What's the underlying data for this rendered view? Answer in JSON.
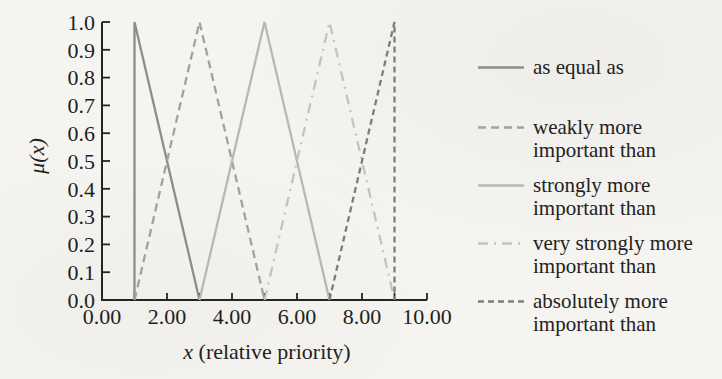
{
  "figure": {
    "background_color": "#f5f4f0",
    "axis_color": "#242424",
    "text_color": "#1f1f1f"
  },
  "chart_data": {
    "type": "line",
    "title": "",
    "xlabel": "x (relative priority)",
    "xlabel_parts": {
      "var": "x",
      "rest": " (relative priority)"
    },
    "ylabel": "μ(x)",
    "xlim": [
      0,
      10
    ],
    "ylim": [
      0,
      1
    ],
    "grid": false,
    "legend_position": "right",
    "x_major_ticks": {
      "values": [
        0,
        2,
        4,
        6,
        8,
        10
      ],
      "labels": [
        "0.00",
        "2.00",
        "4.00",
        "6.00",
        "8.00",
        "10.00"
      ]
    },
    "x_minor_tick_values": [
      1,
      2,
      3,
      4,
      5,
      6,
      7,
      8,
      9,
      10
    ],
    "y_ticks": {
      "values": [
        0,
        0.1,
        0.2,
        0.3,
        0.4,
        0.5,
        0.6,
        0.7,
        0.8,
        0.9,
        1.0
      ],
      "labels": [
        "0.0",
        "0.1",
        "0.2",
        "0.3",
        "0.4",
        "0.5",
        "0.6",
        "0.7",
        "0.8",
        "0.9",
        "1.0"
      ]
    },
    "series": [
      {
        "name": "as equal as",
        "label_lines": [
          "as equal as"
        ],
        "x": [
          1,
          1,
          3
        ],
        "y": [
          0,
          1,
          0
        ],
        "color": "#8d8d8d",
        "dash": "solid"
      },
      {
        "name": "weakly more important than",
        "label_lines": [
          "weakly more",
          "important than"
        ],
        "x": [
          1,
          3,
          5
        ],
        "y": [
          0,
          1,
          0
        ],
        "color": "#a1a1a1",
        "dash": "dashed"
      },
      {
        "name": "strongly more important than",
        "label_lines": [
          "strongly more",
          "important than"
        ],
        "x": [
          3,
          5,
          7
        ],
        "y": [
          0,
          1,
          0
        ],
        "color": "#b7b7b7",
        "dash": "solid"
      },
      {
        "name": "very strongly more important than",
        "label_lines": [
          "very strongly more",
          "important than"
        ],
        "x": [
          5,
          7,
          9
        ],
        "y": [
          0,
          1,
          0
        ],
        "color": "#c3c3c3",
        "dash": "dashdot"
      },
      {
        "name": "absolutely more important than",
        "label_lines": [
          "absolutely more",
          "important than"
        ],
        "x": [
          7,
          9,
          9
        ],
        "y": [
          0,
          1,
          0
        ],
        "color": "#7d7d7d",
        "dash": "short-dash"
      }
    ]
  }
}
